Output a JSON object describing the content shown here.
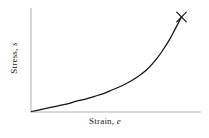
{
  "figure": {
    "background_color": "#ffffff",
    "axis_color": "#b4b4b4",
    "curve_color": "#141414",
    "marker_color": "#141414"
  },
  "axes": {
    "y": {
      "label_text": "Stress,",
      "label_symbol": "s"
    },
    "x": {
      "label_text": "Strain,",
      "label_symbol": "e"
    }
  },
  "marker": {
    "glyph": "×",
    "name": "fracture-point-marker"
  },
  "chart_data": {
    "type": "line",
    "title": "",
    "xlabel": "Strain, e",
    "ylabel": "Stress, s",
    "xlim": [
      0,
      1
    ],
    "ylim": [
      0,
      1
    ],
    "grid": false,
    "legend": null,
    "series": [
      {
        "name": "stress-strain-curve",
        "x": [
          0.0,
          0.06,
          0.12,
          0.18,
          0.24,
          0.3,
          0.36,
          0.42,
          0.48,
          0.54,
          0.6,
          0.66,
          0.72,
          0.78,
          0.84,
          0.88,
          0.92,
          0.96,
          1.0
        ],
        "y": [
          0.0,
          0.02,
          0.04,
          0.06,
          0.08,
          0.11,
          0.13,
          0.16,
          0.19,
          0.23,
          0.27,
          0.32,
          0.38,
          0.46,
          0.57,
          0.66,
          0.76,
          0.88,
          1.0
        ]
      }
    ],
    "annotations": [
      {
        "type": "marker",
        "symbol": "×",
        "x": 1.0,
        "y": 1.0,
        "label": "fracture point"
      }
    ]
  }
}
